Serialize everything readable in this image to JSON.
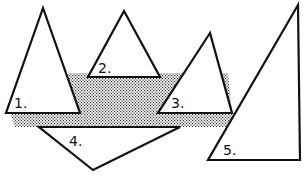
{
  "diagram": {
    "colors": {
      "stroke": "#111111",
      "fill": "#ffffff",
      "shade": "#555555"
    },
    "shaded_region": {
      "points": "70,73 228,73 232,113 232,127 15,127 10,113"
    },
    "triangles": [
      {
        "id": 1,
        "label": "1.",
        "points": "43,8 6,113 80,113",
        "label_x": 14,
        "label_y": 108
      },
      {
        "id": 2,
        "label": "2.",
        "points": "124,11 88,77 160,77",
        "label_x": 98,
        "label_y": 73
      },
      {
        "id": 3,
        "label": "3.",
        "points": "210,33 158,113 232,113",
        "label_x": 171,
        "label_y": 108
      },
      {
        "id": 4,
        "label": "4.",
        "points": "39,127 180,127 93,170",
        "label_x": 69,
        "label_y": 146
      },
      {
        "id": 5,
        "label": "5.",
        "points": "298,5 208,160 300,160",
        "label_x": 223,
        "label_y": 155
      }
    ]
  }
}
